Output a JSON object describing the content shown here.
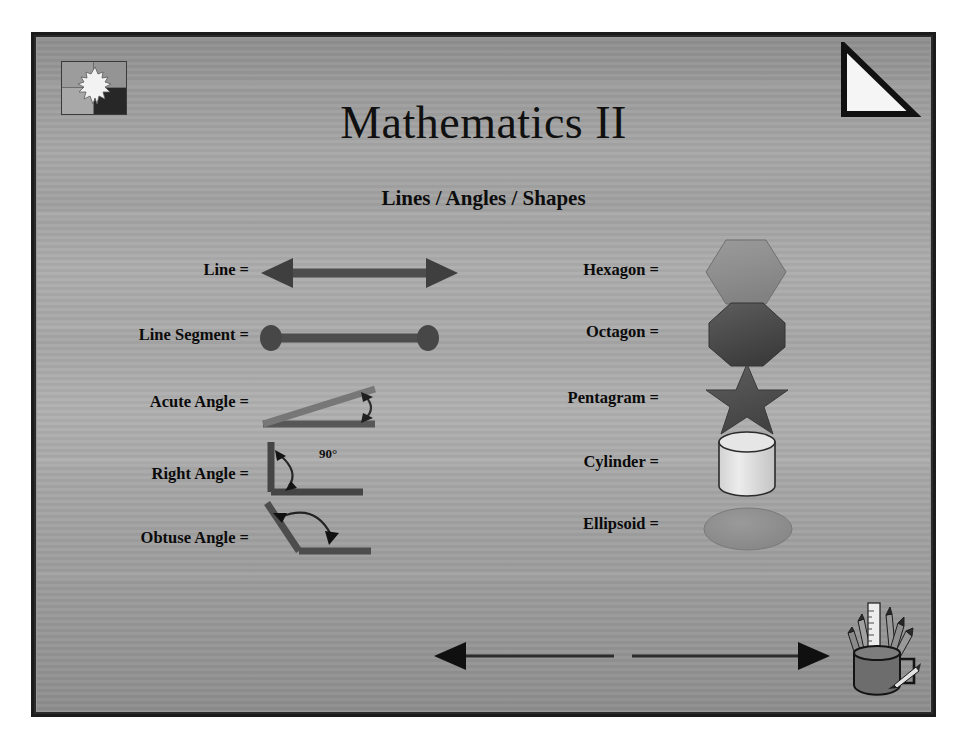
{
  "slide": {
    "title": "Mathematics II",
    "subtitle": "Lines / Angles / Shapes"
  },
  "decorations": {
    "logo_icon": "puzzle-star-logo-icon",
    "corner_icon": "right-triangle-icon",
    "bottom_arrow_icon": "double-headed-arrow-icon",
    "pencil_cup_icon": "pencil-cup-icon"
  },
  "left_column": [
    {
      "label": "Line =",
      "figure": "double-headed-arrow"
    },
    {
      "label": "Line Segment =",
      "figure": "line-segment-with-endpoints"
    },
    {
      "label": "Acute Angle  =",
      "figure": "acute-angle-diagram"
    },
    {
      "label": "Right Angle =",
      "figure": "right-angle-diagram",
      "annotation": "90°"
    },
    {
      "label": "Obtuse Angle =",
      "figure": "obtuse-angle-diagram"
    }
  ],
  "right_column": [
    {
      "label": "Hexagon =",
      "figure": "hexagon-shape"
    },
    {
      "label": "Octagon =",
      "figure": "octagon-shape"
    },
    {
      "label": "Pentagram =",
      "figure": "pentagram-shape"
    },
    {
      "label": "Cylinder =",
      "figure": "cylinder-shape"
    },
    {
      "label": "Ellipsoid =",
      "figure": "ellipsoid-shape"
    }
  ],
  "colors": {
    "slide_background": "#a5a5a5",
    "frame": "#1c1c1c",
    "text": "#0b0b0b",
    "figure_dark": "#4a4a4a",
    "figure_mid": "#7d7d7d",
    "figure_light": "#d8d8d8"
  }
}
